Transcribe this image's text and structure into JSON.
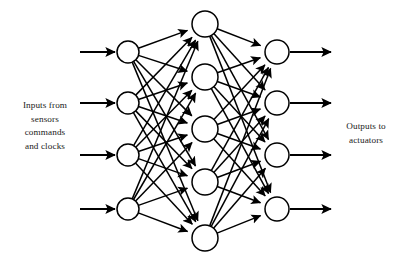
{
  "diagram": {
    "type": "neural-network",
    "background_color": "#ffffff",
    "stroke_color": "#000000",
    "node_fill_color": "#ffffff",
    "text_color": "#1a1a1a"
  },
  "labels": {
    "input": {
      "lines": [
        "Inputs from",
        "sensors",
        "commands",
        "and clocks"
      ]
    },
    "output": {
      "lines": [
        "Outputs to",
        "actuators"
      ]
    }
  },
  "layers": [
    {
      "name": "input-layer",
      "count": 4,
      "radius": 11,
      "cx": 128,
      "cy": [
        52,
        103,
        155,
        209
      ]
    },
    {
      "name": "hidden-layer",
      "count": 5,
      "radius": 13,
      "cx": 205,
      "cy": [
        24,
        77,
        129,
        182,
        238
      ]
    },
    {
      "name": "output-layer",
      "count": 4,
      "radius": 12,
      "cx": 277,
      "cy": [
        52,
        103,
        155,
        209
      ]
    }
  ],
  "input_arrows": {
    "x_start": 80,
    "x_end": 115,
    "y": [
      52,
      103,
      155,
      209
    ]
  },
  "output_arrows": {
    "x_start": 290,
    "x_end": 331,
    "y": [
      52,
      103,
      155,
      209
    ]
  }
}
